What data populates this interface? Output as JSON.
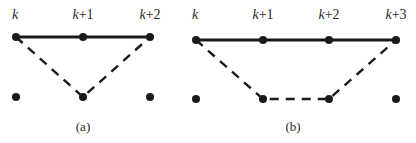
{
  "panels": [
    {
      "id": "a",
      "caption": "(a)",
      "labels": [
        "k",
        "k+1",
        "k+2"
      ],
      "top_row_nodes": 3,
      "bottom_row_nodes": 3,
      "solid_path": [
        [
          "top",
          0
        ],
        [
          "top",
          1
        ],
        [
          "top",
          2
        ]
      ],
      "dashed_path": [
        [
          "top",
          0
        ],
        [
          "bottom",
          1
        ],
        [
          "top",
          2
        ]
      ]
    },
    {
      "id": "b",
      "caption": "(b)",
      "labels": [
        "k",
        "k+1",
        "k+2",
        "k+3"
      ],
      "top_row_nodes": 4,
      "bottom_row_nodes": 4,
      "solid_path": [
        [
          "top",
          0
        ],
        [
          "top",
          1
        ],
        [
          "top",
          2
        ],
        [
          "top",
          3
        ]
      ],
      "dashed_path": [
        [
          "top",
          0
        ],
        [
          "bottom",
          1
        ],
        [
          "bottom",
          2
        ],
        [
          "top",
          3
        ]
      ]
    }
  ]
}
